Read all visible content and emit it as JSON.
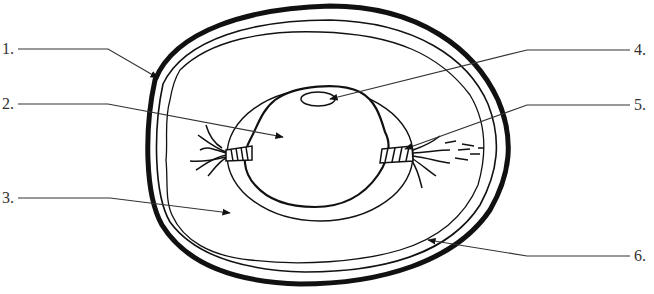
{
  "diagram": {
    "colors": {
      "stroke": "#111111",
      "label_text": "#333333",
      "background": "#ffffff"
    },
    "labels": [
      {
        "id": 1,
        "text": "1.",
        "side": "left",
        "x": 2,
        "y": 41,
        "points_to": "outer-shell"
      },
      {
        "id": 2,
        "text": "2.",
        "side": "left",
        "x": 2,
        "y": 96,
        "points_to": "yolk"
      },
      {
        "id": 3,
        "text": "3.",
        "side": "left",
        "x": 2,
        "y": 192,
        "points_to": "albumen"
      },
      {
        "id": 4,
        "text": "4.",
        "side": "right",
        "x": 632,
        "y": 42,
        "points_to": "germinal-disc"
      },
      {
        "id": 5,
        "text": "5.",
        "side": "right",
        "x": 632,
        "y": 97,
        "points_to": "chalaza"
      },
      {
        "id": 6,
        "text": "6.",
        "side": "right",
        "x": 632,
        "y": 248,
        "points_to": "shell-membrane"
      }
    ]
  }
}
